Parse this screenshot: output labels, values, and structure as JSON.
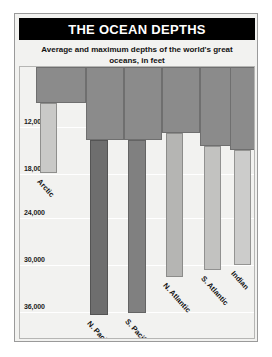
{
  "chart_data": {
    "type": "bar",
    "title": "THE OCEAN DEPTHS",
    "subtitle": "Average and maximum depths of the world's great oceans, in feet",
    "xlabel": "",
    "ylabel": "",
    "ylim": [
      0,
      37500
    ],
    "y_axis_inverted": true,
    "grid": true,
    "legend": "none",
    "tick_labels": [
      "12,000",
      "18,000",
      "24,000",
      "30,000",
      "36,000"
    ],
    "tick_values": [
      12000,
      18000,
      24000,
      30000,
      36000
    ],
    "categories": [
      "Arctic",
      "N. Pacific",
      "S. Pacific",
      "N. Atlantic",
      "S. Atlantic",
      "Indian"
    ],
    "series": [
      {
        "name": "Average depth",
        "values": [
          3000,
          14000,
          14000,
          12000,
          13000,
          13000
        ],
        "color": "#8b8b8b"
      },
      {
        "name": "Maximum depth",
        "values": [
          12000,
          30000,
          29800,
          25200,
          24300,
          23700
        ],
        "color": "#6e6e6e"
      }
    ]
  },
  "bars": [
    {
      "label": "Arctic",
      "avg_top_px": 0,
      "avg_bottom_px": 36,
      "avg_left_px": 16,
      "avg_width_px": 50,
      "max_left_px": 20,
      "max_width_px": 17,
      "max_bottom_px": 106,
      "max_color": "#c9c9c7",
      "max_border": "#8f8f8d",
      "label_left_px": 22,
      "label_top_px": 110
    },
    {
      "label": "N. Pacific",
      "avg_top_px": 0,
      "avg_bottom_px": 73,
      "avg_left_px": 66,
      "avg_width_px": 38,
      "max_left_px": 70,
      "max_width_px": 18,
      "max_bottom_px": 248,
      "max_color": "#6e6e6e",
      "max_border": "#545454",
      "label_left_px": 72,
      "label_top_px": 252
    },
    {
      "label": "S. Pacific",
      "avg_top_px": 0,
      "avg_bottom_px": 73,
      "avg_left_px": 104,
      "avg_width_px": 38,
      "max_left_px": 108,
      "max_width_px": 18,
      "max_bottom_px": 246,
      "max_color": "#808080",
      "max_border": "#646464",
      "label_left_px": 110,
      "label_top_px": 250
    },
    {
      "label": "N. Atlantic",
      "avg_top_px": 0,
      "avg_bottom_px": 66,
      "avg_left_px": 142,
      "avg_width_px": 38,
      "max_left_px": 146,
      "max_width_px": 17,
      "max_bottom_px": 210,
      "max_color": "#b5b5b3",
      "max_border": "#8c8c8a",
      "label_left_px": 148,
      "label_top_px": 214
    },
    {
      "label": "S. Atlantic",
      "avg_top_px": 0,
      "avg_bottom_px": 79,
      "avg_left_px": 180,
      "avg_width_px": 38,
      "max_left_px": 184,
      "max_width_px": 17,
      "max_bottom_px": 203,
      "max_color": "#c2c2c0",
      "max_border": "#919190",
      "label_left_px": 186,
      "label_top_px": 207
    },
    {
      "label": "Indian",
      "avg_top_px": 0,
      "avg_bottom_px": 83,
      "avg_left_px": 210,
      "avg_width_px": 42,
      "max_left_px": 214,
      "max_width_px": 17,
      "max_bottom_px": 198,
      "max_color": "#cccccb",
      "max_border": "#949492",
      "label_left_px": 216,
      "label_top_px": 202
    }
  ],
  "gridlines_px": [
    60,
    107,
    151,
    198,
    245
  ]
}
